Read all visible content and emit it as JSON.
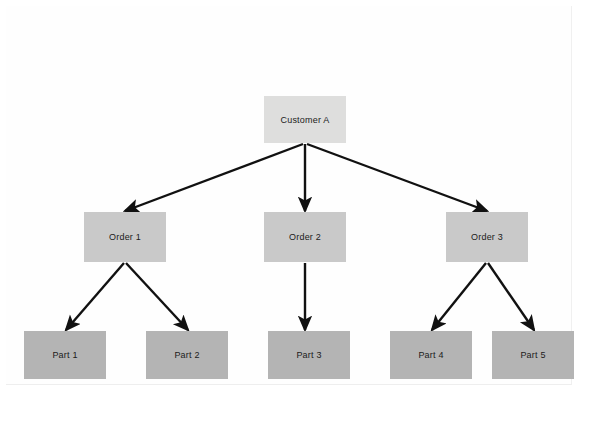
{
  "diagram": {
    "type": "tree",
    "title": "",
    "background_color": "#ffffff",
    "edge_color": "#111111",
    "levels": [
      {
        "name": "root",
        "fill": "#dededd"
      },
      {
        "name": "order",
        "fill": "#c9c9c9"
      },
      {
        "name": "part",
        "fill": "#b4b4b4"
      }
    ],
    "nodes": [
      {
        "id": "customer-a",
        "label": "Customer A",
        "level": "root",
        "x": 264,
        "y": 96,
        "w": 82,
        "h": 47
      },
      {
        "id": "order-1",
        "label": "Order 1",
        "level": "order",
        "x": 84,
        "y": 212,
        "w": 82,
        "h": 50
      },
      {
        "id": "order-2",
        "label": "Order 2",
        "level": "order",
        "x": 264,
        "y": 212,
        "w": 82,
        "h": 50
      },
      {
        "id": "order-3",
        "label": "Order 3",
        "level": "order",
        "x": 446,
        "y": 212,
        "w": 82,
        "h": 50
      },
      {
        "id": "part-1",
        "label": "Part 1",
        "level": "part",
        "x": 24,
        "y": 331,
        "w": 82,
        "h": 48
      },
      {
        "id": "part-2",
        "label": "Part 2",
        "level": "part",
        "x": 146,
        "y": 331,
        "w": 82,
        "h": 48
      },
      {
        "id": "part-3",
        "label": "Part 3",
        "level": "part",
        "x": 268,
        "y": 331,
        "w": 82,
        "h": 48
      },
      {
        "id": "part-4",
        "label": "Part 4",
        "level": "part",
        "x": 390,
        "y": 331,
        "w": 82,
        "h": 48
      },
      {
        "id": "part-5",
        "label": "Part 5",
        "level": "part",
        "x": 492,
        "y": 331,
        "w": 82,
        "h": 48
      }
    ],
    "edges": [
      {
        "from": "customer-a",
        "to": "order-1",
        "x1": 303,
        "y1": 144,
        "x2": 125,
        "y2": 211
      },
      {
        "from": "customer-a",
        "to": "order-2",
        "x1": 305,
        "y1": 144,
        "x2": 305,
        "y2": 211
      },
      {
        "from": "customer-a",
        "to": "order-3",
        "x1": 307,
        "y1": 144,
        "x2": 487,
        "y2": 211
      },
      {
        "from": "order-1",
        "to": "part-1",
        "x1": 124,
        "y1": 263,
        "x2": 66,
        "y2": 330
      },
      {
        "from": "order-1",
        "to": "part-2",
        "x1": 126,
        "y1": 263,
        "x2": 188,
        "y2": 330
      },
      {
        "from": "order-2",
        "to": "part-3",
        "x1": 305,
        "y1": 263,
        "x2": 305,
        "y2": 330
      },
      {
        "from": "order-3",
        "to": "part-4",
        "x1": 486,
        "y1": 263,
        "x2": 432,
        "y2": 330
      },
      {
        "from": "order-3",
        "to": "part-5",
        "x1": 488,
        "y1": 263,
        "x2": 534,
        "y2": 330
      }
    ]
  }
}
